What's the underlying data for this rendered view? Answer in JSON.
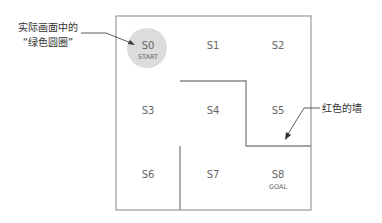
{
  "diagram": {
    "cells": [
      {
        "id": "S0",
        "label": "S0",
        "sub": "START"
      },
      {
        "id": "S1",
        "label": "S1",
        "sub": ""
      },
      {
        "id": "S2",
        "label": "S2",
        "sub": ""
      },
      {
        "id": "S3",
        "label": "S3",
        "sub": ""
      },
      {
        "id": "S4",
        "label": "S4",
        "sub": ""
      },
      {
        "id": "S5",
        "label": "S5",
        "sub": ""
      },
      {
        "id": "S6",
        "label": "S6",
        "sub": ""
      },
      {
        "id": "S7",
        "label": "S7",
        "sub": ""
      },
      {
        "id": "S8",
        "label": "S8",
        "sub": "GOAL"
      }
    ],
    "annotations": {
      "circle_line1": "实际画面中的",
      "circle_line2": "“绿色圆圈”",
      "wall": "红色的墙"
    },
    "colors": {
      "border": "#999999",
      "wall": "#888888",
      "circle": "#dcdcdc",
      "text": "#666666",
      "annotation": "#333333"
    }
  }
}
